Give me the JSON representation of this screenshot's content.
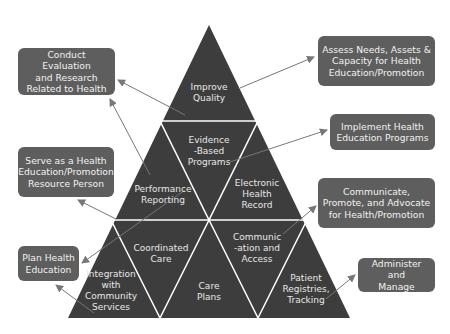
{
  "colors": {
    "pyramid_fill": "#3d3d3d",
    "divider": "#ffffff",
    "box_fill": "#5e5e5e",
    "box_text": "#f2f2f2",
    "tri_text": "#e8e8e8",
    "arrow": "#777777",
    "background": "#ffffff"
  },
  "pyramid": {
    "segments": [
      {
        "id": "improve-quality",
        "label": "Improve\nQuality"
      },
      {
        "id": "evidence-based-programs",
        "label": "Evidence\n-Based\nPrograms"
      },
      {
        "id": "performance-reporting",
        "label": "Performance\nReporting"
      },
      {
        "id": "electronic-health-record",
        "label": "Electronic\nHealth\nRecord"
      },
      {
        "id": "coordinated-care",
        "label": "Coordinated\nCare"
      },
      {
        "id": "communication-and-access",
        "label": "Communic\n-ation and\nAccess"
      },
      {
        "id": "integration-community-services",
        "label": "Integration\nwith\nCommunity\nServices"
      },
      {
        "id": "care-plans",
        "label": "Care\nPlans"
      },
      {
        "id": "patient-registries-tracking",
        "label": "Patient\nRegistries,\nTracking"
      }
    ]
  },
  "responsibilities": {
    "left": [
      {
        "id": "conduct-evaluation",
        "label": "Conduct Evaluation\nand Research\nRelated to Health"
      },
      {
        "id": "serve-resource-person",
        "label": "Serve as a Health\nEducation/Promotion\nResource Person"
      },
      {
        "id": "plan-health-education",
        "label": "Plan Health\nEducation"
      }
    ],
    "right": [
      {
        "id": "assess-needs",
        "label": "Assess Needs, Assets &\nCapacity for Health\nEducation/Promotion"
      },
      {
        "id": "implement-programs",
        "label": "Implement Health\nEducation Programs"
      },
      {
        "id": "communicate-promote-advocate",
        "label": "Communicate,\nPromote, and Advocate\nfor Health/Promotion"
      },
      {
        "id": "administer-manage",
        "label": "Administer and\nManage"
      }
    ]
  }
}
